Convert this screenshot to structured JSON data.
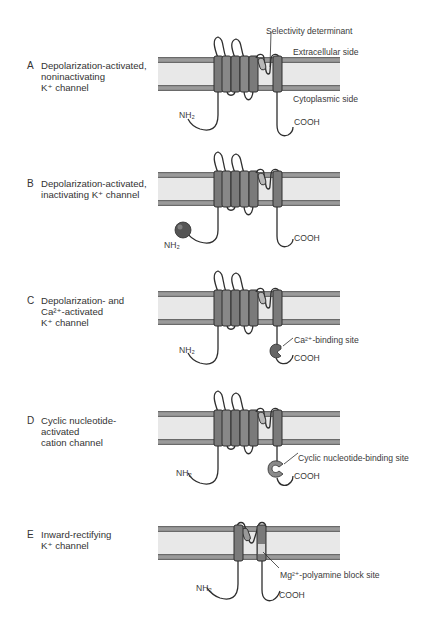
{
  "figure": {
    "colors": {
      "membrane_band": "#8f8f8f",
      "membrane_core": "#e6e6e6",
      "helix_fill": "#7d7d7d",
      "helix_stroke": "#2e2e2e",
      "loop_stroke": "#2e2e2e",
      "ball_fill": "#555555",
      "binding_site_fill": "#8a8a8a",
      "block_site_fill": "#d0d0d0"
    },
    "panels": [
      {
        "letter": "A",
        "title_lines": [
          "Depolarization-activated,",
          "noninactivating",
          "K⁺ channel"
        ],
        "annotations": {
          "selectivity": "Selectivity determinant",
          "extracellular": "Extracellular side",
          "cytoplasmic": "Cytoplasmic side",
          "nterm": "NH₂",
          "cterm": "COOH"
        }
      },
      {
        "letter": "B",
        "title_lines": [
          "Depolarization-activated,",
          "inactivating K⁺ channel"
        ],
        "annotations": {
          "nterm": "NH₂",
          "cterm": "COOH"
        }
      },
      {
        "letter": "C",
        "title_lines": [
          "Depolarization- and",
          "Ca²⁺-activated",
          "K⁺ channel"
        ],
        "annotations": {
          "nterm": "NH₂",
          "cterm": "COOH",
          "site": "Ca²⁺-binding site"
        }
      },
      {
        "letter": "D",
        "title_lines": [
          "Cyclic nucleotide-",
          "activated",
          "cation channel"
        ],
        "annotations": {
          "nterm": "NH₂",
          "cterm": "COOH",
          "site": "Cyclic nucleotide-binding site"
        }
      },
      {
        "letter": "E",
        "title_lines": [
          "Inward-rectifying",
          "K⁺ channel"
        ],
        "annotations": {
          "nterm": "NH₂",
          "cterm": "COOH",
          "site": "Mg²⁺-polyamine block site"
        }
      }
    ]
  }
}
